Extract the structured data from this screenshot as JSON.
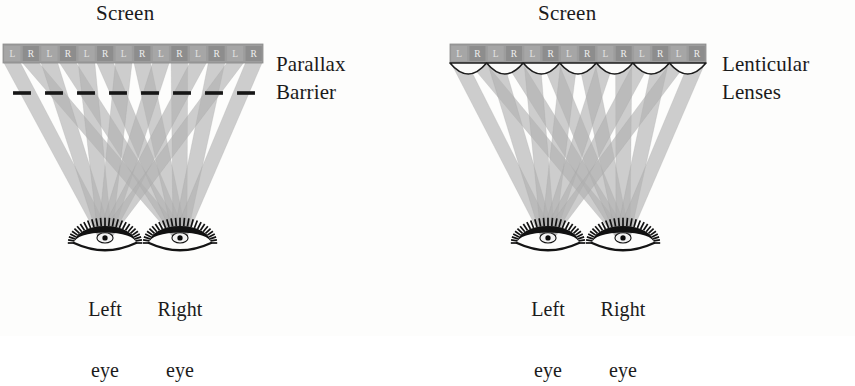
{
  "figure": {
    "background_color": "#fdfdfc",
    "ink_color": "#1b1b1b",
    "beam_color": "#a9a9a9",
    "strip_color": "#9b9b9b",
    "cell_color": "#8c8c8c"
  },
  "diagrams": [
    {
      "id": "parallax-barrier",
      "screen_title": "Screen",
      "method_label_line1": "Parallax",
      "method_label_line2": "Barrier",
      "optic_type": "dashed-barrier",
      "pixel_labels": [
        "L",
        "R",
        "L",
        "R",
        "L",
        "R",
        "L",
        "R",
        "L",
        "R",
        "L",
        "R",
        "L",
        "R"
      ],
      "left_eye_label_line1": "Left",
      "left_eye_label_line2": "eye",
      "right_eye_label_line1": "Right",
      "right_eye_label_line2": "eye"
    },
    {
      "id": "lenticular-lenses",
      "screen_title": "Screen",
      "method_label_line1": "Lenticular",
      "method_label_line2": "Lenses",
      "optic_type": "lenticular-lenses",
      "pixel_labels": [
        "L",
        "R",
        "L",
        "R",
        "L",
        "R",
        "L",
        "R",
        "L",
        "R",
        "L",
        "R",
        "L",
        "R"
      ],
      "left_eye_label_line1": "Left",
      "left_eye_label_line2": "eye",
      "right_eye_label_line1": "Right",
      "right_eye_label_line2": "eye"
    }
  ],
  "geometry": {
    "left": {
      "strip_x": 3,
      "strip_y": 44,
      "strip_w": 260,
      "strip_h": 19,
      "cells": 14,
      "barrier_y": 93,
      "barrier_x0": 6,
      "barrier_x1": 262,
      "barrier_dashes": 8,
      "eye_left_cx": 105,
      "eye_right_cx": 180,
      "eye_cy": 243,
      "eye_rx": 31,
      "eye_ry": 17
    },
    "right": {
      "strip_x": 450,
      "strip_y": 44,
      "strip_w": 256,
      "strip_h": 19,
      "cells": 14,
      "lens_count": 7,
      "lens_y": 63,
      "lens_h": 11,
      "eye_left_cx": 548,
      "eye_right_cx": 623,
      "eye_cy": 243,
      "eye_rx": 31,
      "eye_ry": 17
    }
  },
  "labels_position": {
    "left_screen_title_x": 96,
    "left_screen_title_y": 4,
    "left_method_x": 276,
    "left_method_y": 55,
    "left_eye_l_x": 75,
    "left_eye_l_y": 259,
    "left_eye_r_x": 148,
    "left_eye_r_y": 259,
    "right_screen_title_x": 538,
    "right_screen_title_y": 4,
    "right_method_x": 722,
    "right_method_y": 55,
    "right_eye_l_x": 518,
    "right_eye_l_y": 259,
    "right_eye_r_x": 591,
    "right_eye_r_y": 259
  }
}
